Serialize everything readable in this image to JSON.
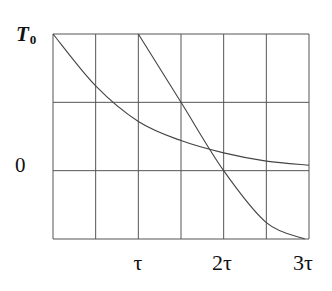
{
  "chart_data": {
    "type": "line",
    "title": "",
    "xlabel": "",
    "ylabel": "",
    "x_ticks": [
      "τ",
      "2τ",
      "3τ"
    ],
    "x_tick_values": [
      1,
      2,
      3
    ],
    "y_ticks": [
      "T",
      "0"
    ],
    "y_tick_subscripts": [
      "0",
      ""
    ],
    "y_tick_values": [
      1,
      0
    ],
    "xlim": [
      0,
      3
    ],
    "ylim": [
      -0.5,
      1
    ],
    "grid": true,
    "grid_columns": 6,
    "grid_rows": 3,
    "legend": null,
    "series": [
      {
        "name": "exponential decay",
        "x": [
          0,
          0.5,
          1,
          1.5,
          2,
          2.5,
          3
        ],
        "y": [
          1,
          0.62,
          0.36,
          0.22,
          0.13,
          0.07,
          0.04
        ]
      },
      {
        "name": "delayed response",
        "x": [
          1,
          1.5,
          2,
          2.5,
          2.95
        ],
        "y": [
          1,
          0.5,
          0,
          -0.38,
          -0.5
        ]
      }
    ]
  }
}
